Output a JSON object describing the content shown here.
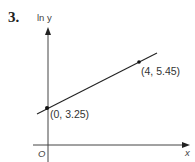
{
  "question_number": "3.",
  "axes": {
    "y_label": "ln y",
    "x_label": "x",
    "origin_label": "O"
  },
  "line": {
    "points": [
      {
        "x": 0,
        "y": 3.25,
        "label": "(0, 3.25)"
      },
      {
        "x": 4,
        "y": 5.45,
        "label": "(4, 5.45)"
      }
    ]
  },
  "colors": {
    "axis": "#333333",
    "line": "#222222",
    "text": "#333333"
  }
}
